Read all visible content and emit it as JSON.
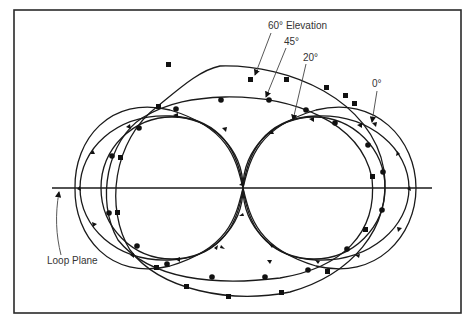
{
  "figure": {
    "type": "antenna-pattern-diagram",
    "labels": {
      "elev60": "60° Elevation",
      "elev45": "45°",
      "elev20": "20°",
      "elev0": "0°",
      "loop_plane": "Loop Plane"
    },
    "curves": [
      {
        "name": "60° Elevation",
        "marker": "square"
      },
      {
        "name": "45°",
        "marker": "circle"
      },
      {
        "name": "20°",
        "marker": "triangle"
      },
      {
        "name": "0°",
        "marker": "triangle"
      }
    ],
    "colors": {
      "line": "#1a1a1a",
      "frame": "#2a2a2a",
      "text": "#333333",
      "background": "#ffffff"
    }
  }
}
